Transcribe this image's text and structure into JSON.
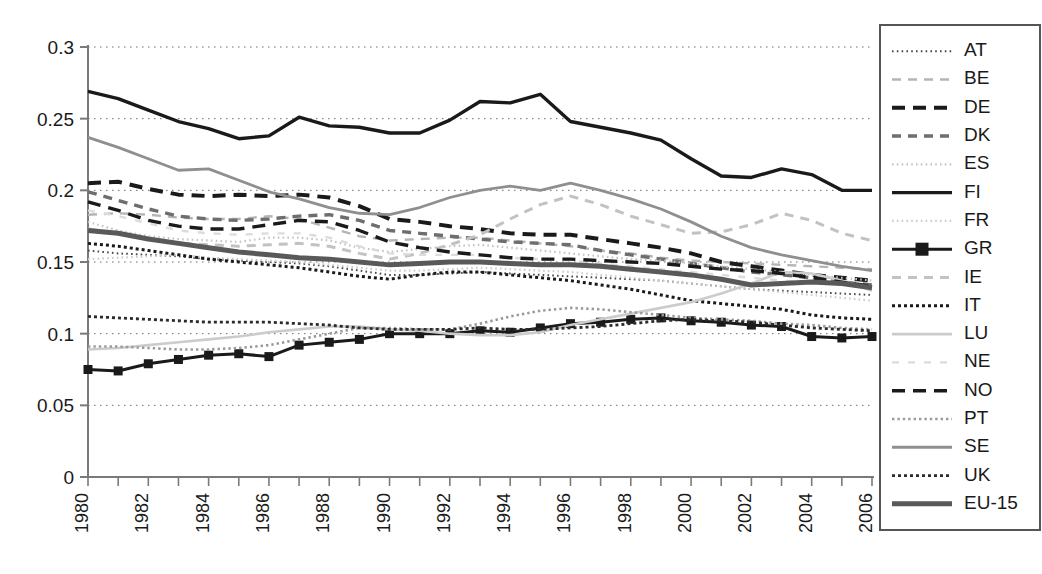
{
  "chart_data": {
    "type": "line",
    "title": "",
    "subtitle": "",
    "xlabel": "",
    "ylabel": "",
    "xlim": [
      1980,
      2006
    ],
    "ylim": [
      0,
      0.3
    ],
    "grid": true,
    "grid_axis": "y",
    "legend_position": "right",
    "y_ticks": [
      "0",
      "0.05",
      "0.1",
      "0.15",
      "0.2",
      "0.25",
      "0.3"
    ],
    "y_tick_values": [
      0,
      0.05,
      0.1,
      0.15,
      0.2,
      0.25,
      0.3
    ],
    "x": [
      1980,
      1981,
      1982,
      1983,
      1984,
      1985,
      1986,
      1987,
      1988,
      1989,
      1990,
      1991,
      1992,
      1993,
      1994,
      1995,
      1996,
      1997,
      1998,
      1999,
      2000,
      2001,
      2002,
      2003,
      2004,
      2005,
      2006
    ],
    "x_tick_labels": [
      "1980",
      "1982",
      "1984",
      "1986",
      "1988",
      "1990",
      "1992",
      "1994",
      "1996",
      "1998",
      "2000",
      "2002",
      "2004",
      "2006"
    ],
    "x_tick_values": [
      1980,
      1982,
      1984,
      1986,
      1988,
      1990,
      1992,
      1994,
      1996,
      1998,
      2000,
      2002,
      2004,
      2006
    ],
    "series": [
      {
        "name": "AT",
        "style": "dotted-fine",
        "color": "#4a4a4a",
        "width": 2.0,
        "marker": "none",
        "values": [
          0.158,
          0.156,
          0.155,
          0.154,
          0.152,
          0.151,
          0.15,
          0.149,
          0.147,
          0.144,
          0.141,
          0.141,
          0.142,
          0.143,
          0.142,
          0.141,
          0.14,
          0.139,
          0.138,
          0.137,
          0.135,
          0.133,
          0.131,
          0.13,
          0.129,
          0.128,
          0.127
        ]
      },
      {
        "name": "BE",
        "style": "dashed",
        "color": "#b5b5b5",
        "width": 2.4,
        "marker": "none",
        "values": [
          0.183,
          0.184,
          0.183,
          0.181,
          0.18,
          0.18,
          0.182,
          0.18,
          0.174,
          0.168,
          0.165,
          0.166,
          0.167,
          0.167,
          0.165,
          0.163,
          0.161,
          0.158,
          0.156,
          0.153,
          0.151,
          0.15,
          0.149,
          0.148,
          0.147,
          0.146,
          0.145
        ]
      },
      {
        "name": "DE",
        "style": "dashed-bold",
        "color": "#1a1a1a",
        "width": 4.0,
        "marker": "none",
        "values": [
          0.205,
          0.206,
          0.201,
          0.197,
          0.196,
          0.197,
          0.196,
          0.197,
          0.195,
          0.189,
          0.18,
          0.178,
          0.175,
          0.173,
          0.17,
          0.169,
          0.169,
          0.166,
          0.163,
          0.16,
          0.156,
          0.15,
          0.147,
          0.144,
          0.141,
          0.139,
          0.137
        ]
      },
      {
        "name": "DK",
        "style": "dashed",
        "color": "#6e6e6e",
        "width": 3.4,
        "marker": "none",
        "values": [
          0.199,
          0.193,
          0.187,
          0.182,
          0.18,
          0.179,
          0.18,
          0.182,
          0.183,
          0.179,
          0.172,
          0.17,
          0.168,
          0.166,
          0.164,
          0.163,
          0.162,
          0.158,
          0.155,
          0.152,
          0.149,
          0.146,
          0.143,
          0.141,
          0.139,
          0.136,
          0.134
        ]
      },
      {
        "name": "ES",
        "style": "dotted-fine",
        "color": "#c4c4c4",
        "width": 2.2,
        "marker": "none",
        "values": [
          0.178,
          0.172,
          0.168,
          0.166,
          0.165,
          0.164,
          0.167,
          0.167,
          0.165,
          0.16,
          0.157,
          0.159,
          0.161,
          0.162,
          0.16,
          0.158,
          0.156,
          0.154,
          0.152,
          0.151,
          0.149,
          0.147,
          0.145,
          0.143,
          0.141,
          0.139,
          0.137
        ]
      },
      {
        "name": "FI",
        "style": "solid",
        "color": "#1a1a1a",
        "width": 3.4,
        "marker": "none",
        "values": [
          0.269,
          0.264,
          0.256,
          0.248,
          0.243,
          0.236,
          0.238,
          0.251,
          0.245,
          0.244,
          0.24,
          0.24,
          0.249,
          0.262,
          0.261,
          0.267,
          0.248,
          0.244,
          0.24,
          0.235,
          0.222,
          0.21,
          0.209,
          0.215,
          0.211,
          0.2,
          0.2
        ]
      },
      {
        "name": "FR",
        "style": "dotted-fine",
        "color": "#cccccc",
        "width": 2.2,
        "marker": "none",
        "values": [
          0.152,
          0.153,
          0.154,
          0.155,
          0.153,
          0.152,
          0.151,
          0.15,
          0.148,
          0.146,
          0.144,
          0.144,
          0.145,
          0.146,
          0.145,
          0.144,
          0.143,
          0.141,
          0.139,
          0.137,
          0.135,
          0.133,
          0.131,
          0.129,
          0.127,
          0.125,
          0.123
        ]
      },
      {
        "name": "GR",
        "style": "solid",
        "color": "#1a1a1a",
        "width": 3.0,
        "marker": "square",
        "values": [
          0.075,
          0.074,
          0.079,
          0.082,
          0.085,
          0.086,
          0.084,
          0.092,
          0.094,
          0.096,
          0.1,
          0.1,
          0.1,
          0.102,
          0.101,
          0.104,
          0.107,
          0.108,
          0.11,
          0.111,
          0.109,
          0.108,
          0.106,
          0.105,
          0.098,
          0.097,
          0.098
        ]
      },
      {
        "name": "IE",
        "style": "dashed",
        "color": "#c2c2c2",
        "width": 3.0,
        "marker": "none",
        "values": [
          0.173,
          0.17,
          0.166,
          0.163,
          0.162,
          0.161,
          0.162,
          0.163,
          0.161,
          0.156,
          0.152,
          0.156,
          0.162,
          0.169,
          0.18,
          0.19,
          0.196,
          0.19,
          0.182,
          0.176,
          0.17,
          0.171,
          0.176,
          0.184,
          0.179,
          0.17,
          0.165
        ]
      },
      {
        "name": "IT",
        "style": "dotted",
        "color": "#1a1a1a",
        "width": 3.0,
        "marker": "none",
        "values": [
          0.163,
          0.161,
          0.158,
          0.155,
          0.152,
          0.15,
          0.148,
          0.146,
          0.143,
          0.14,
          0.138,
          0.141,
          0.143,
          0.143,
          0.141,
          0.139,
          0.137,
          0.134,
          0.131,
          0.127,
          0.123,
          0.121,
          0.119,
          0.117,
          0.113,
          0.111,
          0.11
        ]
      },
      {
        "name": "LU",
        "style": "solid",
        "color": "#cccccc",
        "width": 2.6,
        "marker": "none",
        "values": [
          0.089,
          0.09,
          0.092,
          0.094,
          0.096,
          0.098,
          0.101,
          0.103,
          0.105,
          0.105,
          0.103,
          0.102,
          0.1,
          0.099,
          0.099,
          0.101,
          0.106,
          0.11,
          0.114,
          0.118,
          0.122,
          0.128,
          0.135,
          0.143,
          0.142,
          0.137,
          0.13
        ]
      },
      {
        "name": "NE",
        "style": "dashed-faint",
        "color": "#dcdcdc",
        "width": 2.4,
        "marker": "none",
        "values": [
          0.186,
          0.182,
          0.177,
          0.172,
          0.17,
          0.169,
          0.17,
          0.17,
          0.167,
          0.161,
          0.156,
          0.155,
          0.155,
          0.155,
          0.153,
          0.152,
          0.151,
          0.149,
          0.147,
          0.145,
          0.143,
          0.141,
          0.139,
          0.137,
          0.136,
          0.134,
          0.133
        ]
      },
      {
        "name": "NO",
        "style": "dashed-bold",
        "color": "#1a1a1a",
        "width": 3.4,
        "marker": "none",
        "values": [
          0.192,
          0.186,
          0.179,
          0.175,
          0.173,
          0.173,
          0.176,
          0.179,
          0.178,
          0.172,
          0.164,
          0.16,
          0.157,
          0.155,
          0.153,
          0.152,
          0.152,
          0.151,
          0.15,
          0.149,
          0.147,
          0.145,
          0.144,
          0.142,
          0.139,
          0.136,
          0.133
        ]
      },
      {
        "name": "PT",
        "style": "dotted",
        "color": "#9a9a9a",
        "width": 2.6,
        "marker": "none",
        "values": [
          0.091,
          0.091,
          0.09,
          0.089,
          0.089,
          0.09,
          0.092,
          0.096,
          0.1,
          0.104,
          0.104,
          0.103,
          0.103,
          0.107,
          0.112,
          0.116,
          0.118,
          0.117,
          0.115,
          0.113,
          0.111,
          0.11,
          0.109,
          0.107,
          0.106,
          0.104,
          0.103
        ]
      },
      {
        "name": "SE",
        "style": "solid",
        "color": "#8f8f8f",
        "width": 2.8,
        "marker": "none",
        "values": [
          0.237,
          0.23,
          0.222,
          0.214,
          0.215,
          0.207,
          0.199,
          0.194,
          0.188,
          0.184,
          0.183,
          0.188,
          0.195,
          0.2,
          0.203,
          0.2,
          0.205,
          0.2,
          0.194,
          0.187,
          0.178,
          0.168,
          0.16,
          0.155,
          0.151,
          0.147,
          0.144
        ]
      },
      {
        "name": "UK",
        "style": "dotted",
        "color": "#2b2b2b",
        "width": 2.8,
        "marker": "none",
        "values": [
          0.112,
          0.111,
          0.11,
          0.109,
          0.108,
          0.108,
          0.108,
          0.107,
          0.106,
          0.104,
          0.103,
          0.103,
          0.103,
          0.104,
          0.103,
          0.103,
          0.104,
          0.105,
          0.107,
          0.109,
          0.11,
          0.109,
          0.108,
          0.106,
          0.104,
          0.103,
          0.102
        ]
      },
      {
        "name": "EU-15",
        "style": "solid-thick",
        "color": "#595959",
        "width": 5.0,
        "marker": "none",
        "values": [
          0.172,
          0.17,
          0.166,
          0.163,
          0.16,
          0.157,
          0.155,
          0.153,
          0.152,
          0.15,
          0.148,
          0.149,
          0.15,
          0.15,
          0.149,
          0.148,
          0.148,
          0.147,
          0.145,
          0.143,
          0.141,
          0.138,
          0.134,
          0.135,
          0.136,
          0.135,
          0.132
        ]
      }
    ],
    "legend_entries": [
      "AT",
      "BE",
      "DE",
      "DK",
      "ES",
      "FI",
      "FR",
      "GR",
      "IE",
      "IT",
      "LU",
      "NE",
      "NO",
      "PT",
      "SE",
      "UK",
      "EU-15"
    ]
  },
  "axes": {
    "y_axis_name": "value-axis",
    "x_axis_name": "year-axis"
  }
}
